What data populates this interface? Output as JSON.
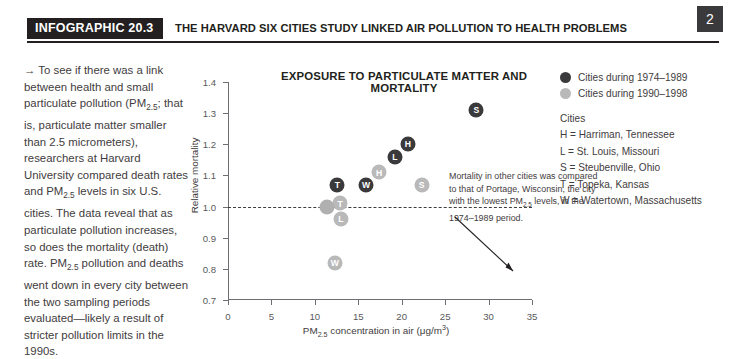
{
  "header": {
    "tag": "INFOGRAPHIC 20.3",
    "title": "THE HARVARD SIX CITIES STUDY LINKED AIR POLLUTION TO HEALTH PROBLEMS",
    "page_number": "2"
  },
  "intro": {
    "arrow": "→",
    "text_html": " To see if there was a link between health and small particulate pollution (PM<sub>2.5</sub>; that is, particulate matter smaller than 2.5 micrometers), researchers at Harvard University compared death rates and PM<sub>2.5</sub> levels in six U.S. cities. The data reveal that as particulate pollution increases, so does the mortality (death) rate. PM<sub>2.5</sub> pollution and deaths went down in every city between the two sampling periods evaluated—likely a result of stricter pollution limits in the 1990s."
  },
  "annotation": {
    "text_html": "Mortality in other cities was compared to that of Portage, Wisconsin, the city with the lowest PM<sub>2.5</sub> levels, in the 1974–1989 period."
  },
  "legend": {
    "series": [
      {
        "label": "Cities during 1974–1989",
        "color": "#3a3a3c",
        "key": "early"
      },
      {
        "label": "Cities during 1990–1998",
        "color": "#b9b9b9",
        "key": "late"
      }
    ],
    "key_title": "Cities",
    "key_items": [
      "H = Harriman, Tennessee",
      "L = St. Louis, Missouri",
      "S = Steubenville, Ohio",
      "T = Topeka, Kansas",
      "W = Watertown, Massachusetts"
    ]
  },
  "chart_data": {
    "type": "scatter",
    "title": "EXPOSURE TO PARTICULATE MATTER AND MORTALITY",
    "xlabel_html": "PM<sub>2.5</sub> concentration in air (μg/m<sup>3</sup>)",
    "ylabel": "Relative mortality",
    "xlim": [
      0,
      35
    ],
    "ylim": [
      0.7,
      1.4
    ],
    "xticks": [
      0,
      5,
      10,
      15,
      20,
      25,
      30,
      35
    ],
    "xtick_labels": [
      "0",
      "5",
      "10",
      "15",
      "20",
      "25",
      "30",
      "35"
    ],
    "yticks": [
      0.7,
      0.8,
      0.9,
      1.0,
      1.1,
      1.2,
      1.3,
      1.4
    ],
    "ytick_labels": [
      "0.7",
      "0.8",
      "0.9",
      "1.0",
      "1.1",
      "1.2",
      "1.3",
      "1.4"
    ],
    "grid": false,
    "reference_line": {
      "y": 1.0,
      "style": "dashed",
      "color": "#3f3c3d"
    },
    "legend_position": "right-outside",
    "series": [
      {
        "name": "Cities during 1974–1989",
        "key": "early",
        "color": "#3a3a3c",
        "points": [
          {
            "label": "T",
            "city": "Topeka, Kansas",
            "x": 12.6,
            "y": 1.07
          },
          {
            "label": "W",
            "city": "Watertown, Massachusetts",
            "x": 15.9,
            "y": 1.07
          },
          {
            "label": "L",
            "city": "St. Louis, Missouri",
            "x": 19.2,
            "y": 1.16
          },
          {
            "label": "H",
            "city": "Harriman, Tennessee",
            "x": 20.7,
            "y": 1.2
          },
          {
            "label": "S",
            "city": "Steubenville, Ohio",
            "x": 28.6,
            "y": 1.31
          }
        ]
      },
      {
        "name": "Cities during 1990–1998",
        "key": "late",
        "color": "#b9b9b9",
        "points": [
          {
            "label": "W",
            "city": "Watertown, Massachusetts",
            "x": 12.3,
            "y": 0.82
          },
          {
            "label": "L",
            "city": "St. Louis, Missouri",
            "x": 13.0,
            "y": 0.96
          },
          {
            "label": "T",
            "city": "Topeka, Kansas",
            "x": 12.9,
            "y": 1.01
          },
          {
            "label": "H",
            "city": "Harriman, Tennessee",
            "x": 17.4,
            "y": 1.11
          },
          {
            "label": "S",
            "city": "Steubenville, Ohio",
            "x": 22.3,
            "y": 1.07
          }
        ]
      },
      {
        "name": "Portage reference",
        "key": "ref",
        "color": "#b0b0b0",
        "points": [
          {
            "label": "",
            "city": "Portage, Wisconsin",
            "x": 11.4,
            "y": 1.0
          }
        ]
      }
    ]
  }
}
